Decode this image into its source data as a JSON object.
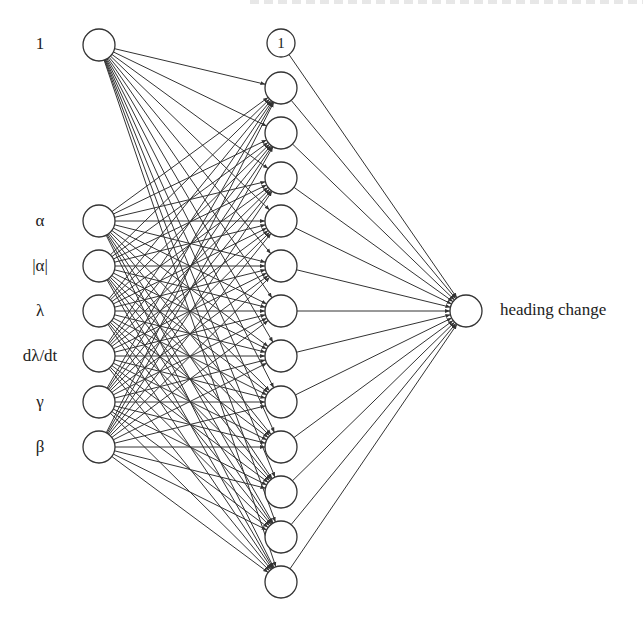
{
  "diagram": {
    "title_cut_off": "",
    "input_layer": {
      "bias": {
        "label": "1",
        "y": 45
      },
      "nodes": [
        {
          "label": "α",
          "y": 221
        },
        {
          "label": "|α|",
          "y": 266
        },
        {
          "label": "λ",
          "y": 311
        },
        {
          "label": "dλ/dt",
          "y": 356
        },
        {
          "label": "γ",
          "y": 402
        },
        {
          "label": "β",
          "y": 447
        }
      ],
      "x": 99,
      "r": 16
    },
    "hidden_layer": {
      "bias": {
        "label": "1",
        "y": 43,
        "r": 14
      },
      "x": 281,
      "r": 16,
      "node_ys": [
        88,
        133,
        178,
        221,
        266,
        311,
        356,
        402,
        447,
        492,
        537,
        582
      ]
    },
    "output_layer": {
      "label": "heading change",
      "x": 466,
      "y": 311,
      "r": 16
    },
    "colors": {
      "stroke": "#333333",
      "background": "#ffffff"
    }
  }
}
